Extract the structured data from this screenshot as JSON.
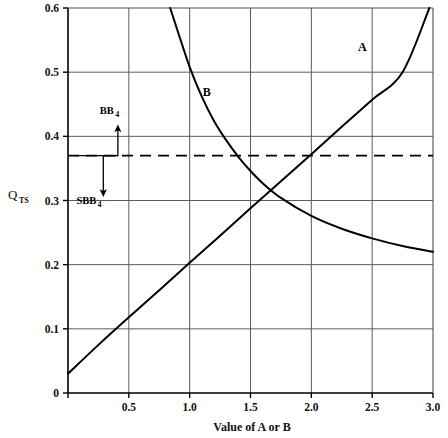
{
  "chart_data": {
    "type": "line",
    "title": "",
    "xlabel": "Value of A or B",
    "ylabel": "Q",
    "ylabel_subscript": "TS",
    "xlim": [
      0,
      3.0
    ],
    "ylim": [
      0,
      0.6
    ],
    "grid": true,
    "legend_position": "inline-annotations",
    "xticks": [
      0.5,
      1.0,
      1.5,
      2.0,
      2.5,
      3.0
    ],
    "xtick_labels": [
      "0.5",
      "1.0",
      "1.5",
      "2.0",
      "2.5",
      "3.0"
    ],
    "yticks": [
      0,
      0.1,
      0.2,
      0.3,
      0.4,
      0.5,
      0.6
    ],
    "ytick_labels": [
      "0",
      "0.1",
      "0.2",
      "0.3",
      "0.4",
      "0.5",
      "0.6"
    ],
    "series": [
      {
        "name": "A",
        "label": "A",
        "label_x": 2.42,
        "label_y": 0.533,
        "style": "solid",
        "x": [
          0.0,
          0.25,
          0.5,
          0.75,
          1.0,
          1.25,
          1.5,
          1.75,
          2.0,
          2.25,
          2.5,
          2.75,
          2.97
        ],
        "y": [
          0.03,
          0.075,
          0.118,
          0.16,
          0.203,
          0.245,
          0.288,
          0.33,
          0.372,
          0.415,
          0.457,
          0.5,
          0.6
        ]
      },
      {
        "name": "B",
        "label": "B",
        "label_x": 1.14,
        "label_y": 0.463,
        "style": "solid",
        "x": [
          0.84,
          0.9,
          1.0,
          1.1,
          1.2,
          1.3,
          1.4,
          1.5,
          1.6,
          1.75,
          2.0,
          2.25,
          2.5,
          2.75,
          3.0
        ],
        "y": [
          0.6,
          0.565,
          0.508,
          0.462,
          0.424,
          0.394,
          0.368,
          0.346,
          0.327,
          0.304,
          0.276,
          0.256,
          0.241,
          0.229,
          0.22
        ]
      }
    ],
    "reference_line": {
      "name": "equilibrium-dashed-line",
      "orientation": "horizontal",
      "value": 0.37,
      "style": "dashed"
    },
    "annotations": [
      {
        "name": "bb4",
        "label": "BB",
        "subscript": "4",
        "arrow": "up",
        "x": 0.41,
        "y_text": 0.435,
        "arrow_from": 0.37,
        "arrow_to": 0.412
      },
      {
        "name": "sbb4",
        "label": "SBB",
        "subscript": "4",
        "arrow": "down",
        "x": 0.29,
        "y_text": 0.295,
        "arrow_from": 0.368,
        "arrow_to": 0.312
      }
    ],
    "colors": {
      "curve": "#000000",
      "grid": "#5b5b5b",
      "axis": "#000000",
      "text": "#111111",
      "background": "#ffffff"
    }
  }
}
